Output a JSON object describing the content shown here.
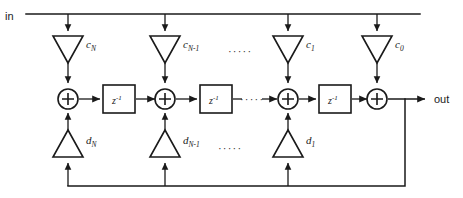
{
  "diagram": {
    "colors": {
      "line": "#1a1a1a",
      "background": "#ffffff",
      "fill": "#ffffff"
    },
    "ports": {
      "input_label": "in",
      "output_label": "out"
    },
    "feedforward_taps": [
      {
        "name": "c-n",
        "base": "c",
        "sub": "N",
        "x": 68
      },
      {
        "name": "c-n-1",
        "base": "c",
        "sub": "N-1",
        "x": 165
      },
      {
        "name": "c-1",
        "base": "c",
        "sub": "1",
        "x": 288
      },
      {
        "name": "c-0",
        "base": "c",
        "sub": "0",
        "x": 377
      }
    ],
    "feedback_taps": [
      {
        "name": "d-n",
        "base": "d",
        "sub": "N",
        "x": 68
      },
      {
        "name": "d-n-1",
        "base": "d",
        "sub": "N-1",
        "x": 165
      },
      {
        "name": "d-1",
        "base": "d",
        "sub": "1",
        "x": 288
      }
    ],
    "adders": [
      {
        "name": "adder-n",
        "x": 68
      },
      {
        "name": "adder-n-1",
        "x": 165
      },
      {
        "name": "adder-1",
        "x": 288
      },
      {
        "name": "adder-0",
        "x": 377
      }
    ],
    "delays": [
      {
        "name": "delay-1",
        "base": "z",
        "exp": "-1",
        "x": 117
      },
      {
        "name": "delay-2",
        "base": "z",
        "exp": "-1",
        "x": 214
      },
      {
        "name": "delay-3",
        "base": "z",
        "exp": "-1",
        "x": 333
      }
    ],
    "ellipses": [
      {
        "name": "ellipsis-top",
        "text": "·····",
        "x": 238,
        "y": 52
      },
      {
        "name": "ellipsis-middle",
        "text": "·····",
        "x": 245,
        "y": 98
      },
      {
        "name": "ellipsis-bottom",
        "text": "·····",
        "x": 228,
        "y": 150
      }
    ],
    "buses": {
      "input_bus_label": "input-distribution-bus",
      "signal_path_label": "forward-signal-path",
      "feedback_bus_label": "output-feedback-bus"
    }
  }
}
